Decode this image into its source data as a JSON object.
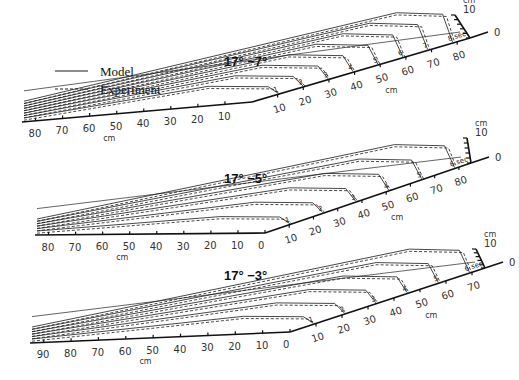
{
  "chart_data": [
    {
      "type": "line",
      "title": "17°  −7°",
      "projection": "oblique-3d",
      "x_near_axis": {
        "ticks": [
          80,
          70,
          60,
          50,
          40,
          30,
          20,
          10
        ],
        "unit": "cm",
        "range": [
          0,
          85
        ]
      },
      "x_far_axis": {
        "ticks": [
          10,
          20,
          30,
          40,
          50,
          60,
          70,
          80
        ],
        "unit": "cm",
        "range": [
          0,
          85
        ]
      },
      "height_axis": {
        "ticks": [
          0,
          10
        ],
        "unit": "cm"
      },
      "time_labels": [
        "1",
        "2",
        "3",
        "4",
        "5",
        "6",
        "7",
        "8 sec"
      ],
      "series": [
        {
          "name": "Model",
          "style": "solid",
          "times": [
            1,
            2,
            3,
            4,
            5,
            6,
            7,
            8
          ]
        },
        {
          "name": "Experiment",
          "style": "dashed",
          "times": [
            1,
            2,
            3,
            4,
            5,
            6,
            7,
            8
          ]
        }
      ]
    },
    {
      "type": "line",
      "title": "17°  −5°",
      "projection": "oblique-3d",
      "x_near_axis": {
        "ticks": [
          80,
          70,
          60,
          50,
          40,
          30,
          20,
          10,
          0
        ],
        "unit": "cm",
        "range": [
          0,
          85
        ]
      },
      "x_far_axis": {
        "ticks": [
          10,
          20,
          30,
          40,
          50,
          60,
          70,
          80
        ],
        "unit": "cm",
        "range": [
          0,
          85
        ]
      },
      "height_axis": {
        "ticks": [
          0,
          10
        ],
        "unit": "cm"
      },
      "time_labels": [
        "1",
        "2",
        "3",
        "4",
        "5",
        "6 sec"
      ],
      "series": [
        {
          "name": "Model",
          "style": "solid",
          "times": [
            1,
            2,
            3,
            4,
            5,
            6
          ]
        },
        {
          "name": "Experiment",
          "style": "dashed",
          "times": [
            1,
            2,
            3,
            4,
            5,
            6
          ]
        }
      ]
    },
    {
      "type": "line",
      "title": "17°  −3°",
      "projection": "oblique-3d",
      "x_near_axis": {
        "ticks": [
          90,
          80,
          70,
          60,
          50,
          40,
          30,
          20,
          10,
          0
        ],
        "unit": "cm",
        "range": [
          0,
          95
        ]
      },
      "x_far_axis": {
        "ticks": [
          10,
          20,
          30,
          40,
          50,
          60,
          70
        ],
        "unit": "cm",
        "range": [
          0,
          75
        ]
      },
      "height_axis": {
        "ticks": [
          0,
          10
        ],
        "unit": "cm"
      },
      "time_labels": [
        "1",
        "2",
        "3",
        "4",
        "5",
        "6 sec"
      ],
      "series": [
        {
          "name": "Model",
          "style": "solid",
          "times": [
            1,
            2,
            3,
            4,
            5,
            6
          ]
        },
        {
          "name": "Experiment",
          "style": "dashed",
          "times": [
            1,
            2,
            3,
            4,
            5,
            6
          ]
        }
      ]
    }
  ],
  "legend": {
    "model_label": "Model",
    "experiment_label": "Experiment"
  },
  "labels": {
    "unit": "cm",
    "zero": "0",
    "ten": "10"
  }
}
